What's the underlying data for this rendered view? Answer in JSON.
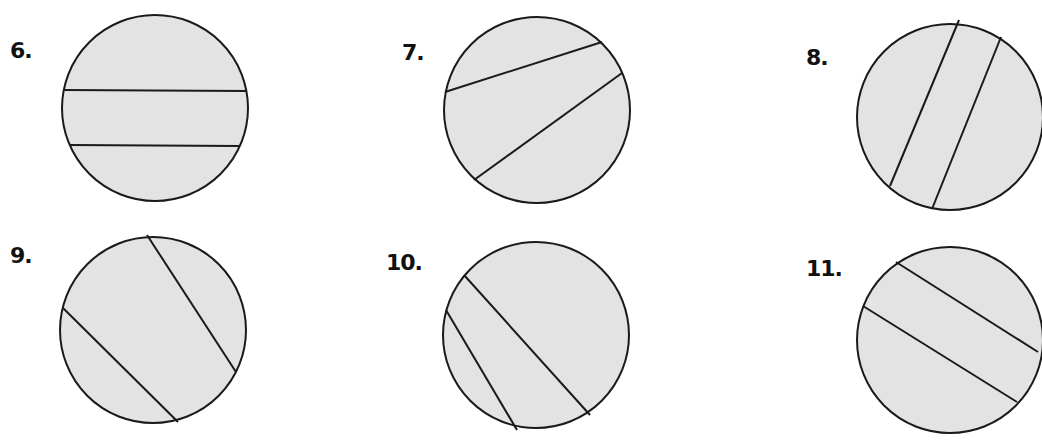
{
  "colors": {
    "fill": "#e3e3e3",
    "stroke": "#1a1a1a",
    "label": "#111111"
  },
  "figures": [
    {
      "label": "6.",
      "label_pos": [
        10,
        38
      ],
      "circle": {
        "cx": 155,
        "cy": 108,
        "r": 93
      },
      "chords": [
        [
          63,
          90,
          247,
          91
        ],
        [
          70,
          145,
          240,
          146
        ]
      ]
    },
    {
      "label": "7.",
      "label_pos": [
        402,
        40
      ],
      "circle": {
        "cx": 537,
        "cy": 110,
        "r": 93
      },
      "chords": [
        [
          445,
          92,
          602,
          42
        ],
        [
          474,
          180,
          622,
          73
        ]
      ]
    },
    {
      "label": "8.",
      "label_pos": [
        806,
        45
      ],
      "circle": {
        "cx": 950,
        "cy": 117,
        "r": 93
      },
      "chords": [
        [
          959,
          20,
          890,
          186
        ],
        [
          1001,
          37,
          932,
          209
        ]
      ]
    },
    {
      "label": "9.",
      "label_pos": [
        10,
        243
      ],
      "circle": {
        "cx": 153,
        "cy": 330,
        "r": 93
      },
      "chords": [
        [
          147,
          235,
          236,
          372
        ],
        [
          63,
          308,
          178,
          422
        ]
      ]
    },
    {
      "label": "10.",
      "label_pos": [
        386,
        250
      ],
      "circle": {
        "cx": 536,
        "cy": 335,
        "r": 93
      },
      "chords": [
        [
          464,
          275,
          590,
          415
        ],
        [
          446,
          310,
          517,
          430
        ]
      ]
    },
    {
      "label": "11.",
      "label_pos": [
        806,
        256
      ],
      "circle": {
        "cx": 950,
        "cy": 340,
        "r": 93
      },
      "chords": [
        [
          896,
          262,
          1038,
          352
        ],
        [
          863,
          306,
          1017,
          402
        ]
      ]
    }
  ]
}
